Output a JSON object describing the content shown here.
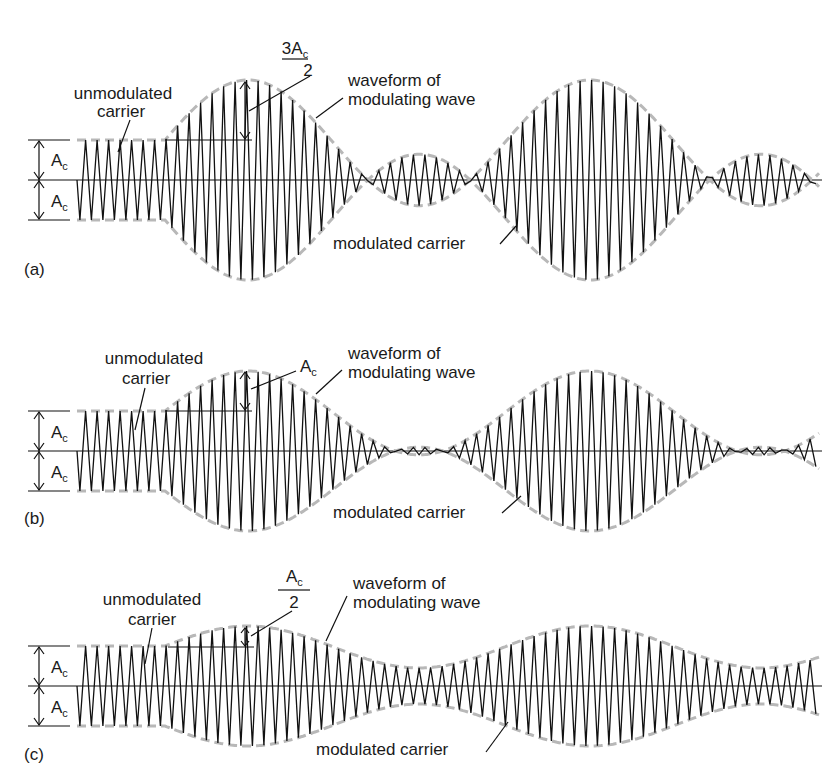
{
  "figure": {
    "panels": [
      {
        "id": "a",
        "panel_label": "(a)",
        "modulation_index": 1.5,
        "axis_y": 180,
        "amplitude_px": 40,
        "peak_dimension_label_num": "3A",
        "peak_dimension_label_sub": "c",
        "peak_dimension_label_den": "2",
        "ac_label": "A",
        "ac_sub": "c",
        "label_unmodulated_1": "unmodulated",
        "label_unmodulated_2": "carrier",
        "label_waveform_1": "waveform of",
        "label_waveform_2": "modulating wave",
        "label_modulated": "modulated carrier"
      },
      {
        "id": "b",
        "panel_label": "(b)",
        "modulation_index": 1.0,
        "axis_y": 451,
        "amplitude_px": 40,
        "peak_dimension_label_num": "A",
        "peak_dimension_label_sub": "c",
        "ac_label": "A",
        "ac_sub": "c",
        "label_unmodulated_1": "unmodulated",
        "label_unmodulated_2": "carrier",
        "label_waveform_1": "waveform of",
        "label_waveform_2": "modulating wave",
        "label_modulated": "modulated carrier"
      },
      {
        "id": "c",
        "panel_label": "(c)",
        "modulation_index": 0.5,
        "axis_y": 686,
        "amplitude_px": 40,
        "peak_dimension_label_num": "A",
        "peak_dimension_label_sub": "c",
        "peak_dimension_label_den": "2",
        "ac_label": "A",
        "ac_sub": "c",
        "label_unmodulated_1": "unmodulated",
        "label_unmodulated_2": "carrier",
        "label_waveform_1": "waveform of",
        "label_waveform_2": "modulating wave",
        "label_modulated": "modulated carrier"
      }
    ],
    "geometry": {
      "wave_start_x": 77,
      "modulation_start_x": 165,
      "wave_end_x": 820,
      "carrier_period_px": 11.5,
      "modulating_period_px": 342,
      "first_peak_x": 248
    },
    "colors": {
      "carrier": "#111111",
      "envelope": "#b8b8b8",
      "text": "#1a1a1a"
    }
  }
}
